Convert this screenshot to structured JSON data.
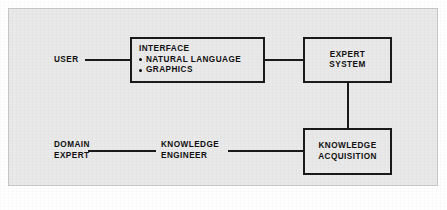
{
  "diagram": {
    "background_color": "#e9e9e9",
    "line_color": "#1a1a1a",
    "text_color": "#111111",
    "nodes": {
      "interface": {
        "heading": "INTERFACE",
        "items": [
          "NATURAL LANGUAGE",
          "GRAPHICS"
        ]
      },
      "expert_system": {
        "line1": "EXPERT",
        "line2": "SYSTEM"
      },
      "knowledge_acquisition": {
        "line1": "KNOWLEDGE",
        "line2": "ACQUISITION"
      }
    },
    "labels": {
      "user": "USER",
      "domain_expert": {
        "line1": "DOMAIN",
        "line2": "EXPERT"
      },
      "knowledge_engineer": {
        "line1": "KNOWLEDGE",
        "line2": "ENGINEER"
      }
    },
    "connectors": [
      "user-to-interface",
      "interface-to-expert-system",
      "expert-system-to-knowledge-acquisition",
      "domain-expert-to-knowledge-engineer",
      "knowledge-engineer-to-knowledge-acquisition"
    ]
  }
}
